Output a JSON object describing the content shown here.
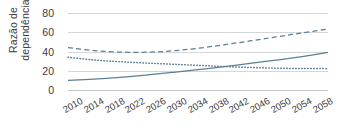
{
  "chart_data": {
    "type": "line",
    "title": "",
    "xlabel": "",
    "ylabel": "Razão de dependência",
    "ylabel_line1": "Razão de",
    "ylabel_line2": "dependência",
    "xlim": [
      2010,
      2060
    ],
    "ylim": [
      0,
      80
    ],
    "yticks": [
      0,
      20,
      40,
      60,
      80
    ],
    "ytick_labels": [
      "0",
      "20",
      "40",
      "60",
      "80"
    ],
    "xticks": [
      2010,
      2014,
      2018,
      2022,
      2026,
      2030,
      2034,
      2038,
      2042,
      2046,
      2050,
      2054,
      2058
    ],
    "xtick_labels": [
      "2010",
      "2014",
      "2018",
      "2022",
      "2026",
      "2030",
      "2034",
      "2038",
      "2042",
      "2046",
      "2050",
      "2054",
      "2058"
    ],
    "grid": true,
    "grid_axis": "y",
    "legend": "none",
    "line_color": "#5b7f96",
    "grid_color": "#d3d7da",
    "x": [
      2010,
      2015,
      2020,
      2025,
      2030,
      2035,
      2040,
      2045,
      2050,
      2055,
      2060
    ],
    "series": [
      {
        "name": "total-dependency-ratio",
        "style": "dashed",
        "color": "#5b7f96",
        "values": [
          44.0,
          41.0,
          39.4,
          39.3,
          40.6,
          43.4,
          47.0,
          51.0,
          55.2,
          59.3,
          63.3
        ]
      },
      {
        "name": "youth-dependency-ratio",
        "style": "dotted",
        "color": "#5b7f96",
        "values": [
          34.0,
          31.2,
          29.4,
          28.0,
          26.8,
          25.6,
          24.4,
          23.4,
          22.7,
          22.3,
          22.2
        ]
      },
      {
        "name": "old-age-dependency-ratio",
        "style": "solid",
        "color": "#5b7f96",
        "values": [
          10.0,
          11.4,
          13.2,
          15.5,
          18.2,
          21.2,
          24.3,
          27.6,
          31.0,
          34.8,
          39.0
        ]
      }
    ]
  }
}
